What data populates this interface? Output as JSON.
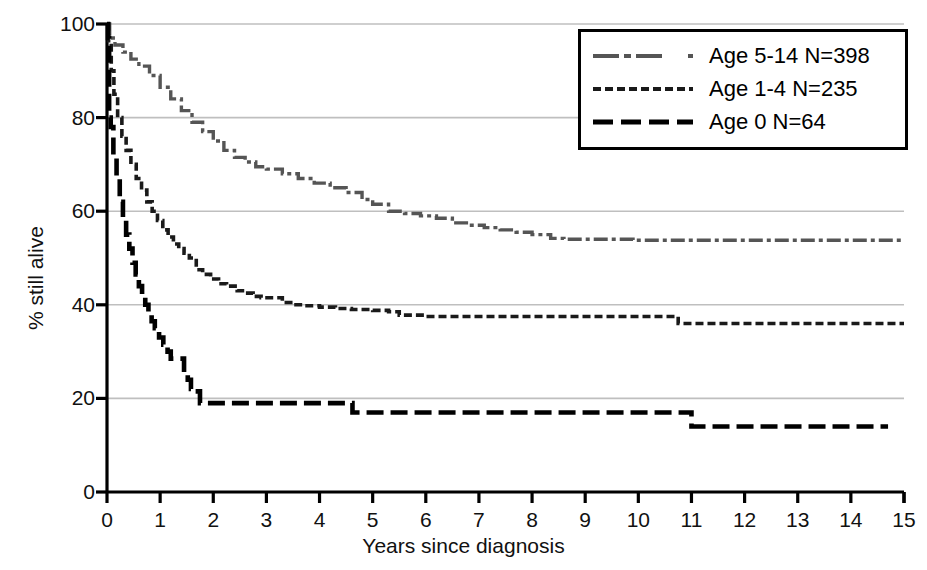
{
  "chart_data": {
    "type": "line",
    "title": "",
    "subtitle": "",
    "xlabel": "Years since diagnosis",
    "ylabel": "% still alive",
    "xlim": [
      0,
      15
    ],
    "ylim": [
      0,
      100
    ],
    "xticks": [
      "0",
      "1",
      "2",
      "3",
      "4",
      "5",
      "6",
      "7",
      "8",
      "9",
      "10",
      "11",
      "12",
      "13",
      "14",
      "15"
    ],
    "yticks": [
      "0",
      "20",
      "40",
      "60",
      "80",
      "100"
    ],
    "grid": "horizontal",
    "legend_position": "top-right",
    "series": [
      {
        "name": "Age 5-14 N=398",
        "label": "Age 5-14 N=398",
        "n": 398,
        "color": "#555555",
        "dash": "dash-dot",
        "points": [
          [
            0.0,
            100.0
          ],
          [
            0.05,
            97.0
          ],
          [
            0.15,
            95.5
          ],
          [
            0.3,
            94.0
          ],
          [
            0.45,
            92.5
          ],
          [
            0.6,
            91.0
          ],
          [
            0.8,
            89.0
          ],
          [
            1.0,
            86.5
          ],
          [
            1.2,
            84.0
          ],
          [
            1.4,
            81.5
          ],
          [
            1.6,
            79.0
          ],
          [
            1.8,
            77.0
          ],
          [
            2.0,
            75.0
          ],
          [
            2.2,
            73.0
          ],
          [
            2.4,
            71.5
          ],
          [
            2.6,
            70.5
          ],
          [
            2.8,
            69.5
          ],
          [
            3.0,
            69.0
          ],
          [
            3.3,
            68.0
          ],
          [
            3.6,
            67.0
          ],
          [
            3.9,
            66.0
          ],
          [
            4.2,
            65.0
          ],
          [
            4.5,
            64.0
          ],
          [
            4.8,
            62.5
          ],
          [
            5.0,
            61.5
          ],
          [
            5.3,
            60.0
          ],
          [
            5.6,
            59.5
          ],
          [
            5.9,
            59.0
          ],
          [
            6.2,
            58.5
          ],
          [
            6.4,
            58.5
          ],
          [
            6.5,
            57.5
          ],
          [
            6.8,
            57.0
          ],
          [
            7.1,
            56.5
          ],
          [
            7.4,
            56.0
          ],
          [
            7.7,
            55.5
          ],
          [
            8.0,
            55.0
          ],
          [
            8.2,
            55.0
          ],
          [
            8.35,
            54.2
          ],
          [
            8.6,
            54.0
          ],
          [
            9.0,
            54.0
          ],
          [
            9.4,
            54.0
          ],
          [
            9.8,
            54.0
          ],
          [
            9.9,
            53.8
          ],
          [
            10.3,
            53.8
          ],
          [
            11.0,
            53.8
          ],
          [
            12.0,
            53.8
          ],
          [
            13.0,
            53.8
          ],
          [
            14.0,
            53.8
          ],
          [
            15.0,
            53.8
          ]
        ]
      },
      {
        "name": "Age 1-4 N=235",
        "label": "Age 1-4 N=235",
        "n": 235,
        "color": "#1a1a1a",
        "dash": "dashed",
        "points": [
          [
            0.0,
            100.0
          ],
          [
            0.03,
            96.0
          ],
          [
            0.08,
            90.0
          ],
          [
            0.13,
            85.0
          ],
          [
            0.2,
            80.0
          ],
          [
            0.28,
            76.0
          ],
          [
            0.36,
            73.0
          ],
          [
            0.45,
            70.0
          ],
          [
            0.55,
            67.0
          ],
          [
            0.65,
            64.5
          ],
          [
            0.75,
            62.0
          ],
          [
            0.85,
            60.0
          ],
          [
            0.95,
            58.0
          ],
          [
            1.05,
            56.0
          ],
          [
            1.15,
            54.5
          ],
          [
            1.25,
            53.0
          ],
          [
            1.35,
            52.0
          ],
          [
            1.45,
            51.0
          ],
          [
            1.55,
            50.0
          ],
          [
            1.62,
            50.0
          ],
          [
            1.68,
            47.5
          ],
          [
            1.8,
            46.5
          ],
          [
            1.95,
            45.5
          ],
          [
            2.1,
            44.5
          ],
          [
            2.25,
            44.0
          ],
          [
            2.35,
            44.0
          ],
          [
            2.45,
            43.0
          ],
          [
            2.6,
            42.5
          ],
          [
            2.75,
            41.8
          ],
          [
            2.9,
            41.5
          ],
          [
            3.0,
            41.5
          ],
          [
            3.15,
            41.5
          ],
          [
            3.3,
            40.5
          ],
          [
            3.5,
            40.0
          ],
          [
            3.7,
            39.8
          ],
          [
            4.0,
            39.5
          ],
          [
            4.3,
            39.2
          ],
          [
            4.6,
            39.0
          ],
          [
            5.0,
            38.8
          ],
          [
            5.3,
            38.5
          ],
          [
            5.5,
            37.8
          ],
          [
            6.0,
            37.5
          ],
          [
            7.0,
            37.5
          ],
          [
            8.0,
            37.5
          ],
          [
            9.0,
            37.5
          ],
          [
            10.0,
            37.5
          ],
          [
            10.6,
            37.5
          ],
          [
            10.75,
            36.0
          ],
          [
            11.5,
            36.0
          ],
          [
            12.5,
            36.0
          ],
          [
            13.5,
            36.0
          ],
          [
            14.5,
            36.0
          ],
          [
            15.0,
            36.0
          ]
        ]
      },
      {
        "name": "Age 0 N=64",
        "label": "Age 0 N=64",
        "n": 64,
        "color": "#000000",
        "dash": "long-dash",
        "points": [
          [
            0.0,
            100.0
          ],
          [
            0.02,
            97.0
          ],
          [
            0.04,
            80.0
          ],
          [
            0.07,
            78.0
          ],
          [
            0.12,
            72.0
          ],
          [
            0.18,
            67.0
          ],
          [
            0.24,
            62.0
          ],
          [
            0.3,
            58.0
          ],
          [
            0.36,
            55.0
          ],
          [
            0.42,
            52.0
          ],
          [
            0.48,
            49.0
          ],
          [
            0.54,
            46.5
          ],
          [
            0.6,
            44.0
          ],
          [
            0.66,
            42.0
          ],
          [
            0.72,
            40.0
          ],
          [
            0.78,
            38.0
          ],
          [
            0.84,
            36.5
          ],
          [
            0.9,
            35.0
          ],
          [
            0.98,
            33.0
          ],
          [
            1.06,
            31.5
          ],
          [
            1.14,
            30.0
          ],
          [
            1.2,
            28.5
          ],
          [
            1.3,
            28.5
          ],
          [
            1.4,
            28.5
          ],
          [
            1.45,
            25.5
          ],
          [
            1.52,
            24.0
          ],
          [
            1.58,
            22.0
          ],
          [
            1.64,
            21.5
          ],
          [
            1.7,
            21.5
          ],
          [
            1.75,
            19.0
          ],
          [
            2.0,
            19.0
          ],
          [
            2.5,
            19.0
          ],
          [
            3.0,
            19.0
          ],
          [
            3.5,
            19.0
          ],
          [
            4.0,
            19.0
          ],
          [
            4.55,
            19.0
          ],
          [
            4.62,
            17.0
          ],
          [
            5.5,
            17.0
          ],
          [
            6.5,
            17.0
          ],
          [
            7.5,
            17.0
          ],
          [
            8.5,
            17.0
          ],
          [
            9.5,
            17.0
          ],
          [
            10.5,
            17.0
          ],
          [
            10.92,
            17.0
          ],
          [
            11.0,
            14.0
          ],
          [
            12.0,
            14.0
          ],
          [
            13.0,
            14.0
          ],
          [
            14.0,
            14.0
          ],
          [
            14.7,
            14.0
          ]
        ]
      }
    ],
    "legend": [
      {
        "label": "Age 5-14 N=398",
        "style": "dash-dot",
        "color": "#555555"
      },
      {
        "label": "Age 1-4 N=235",
        "style": "dashed",
        "color": "#1a1a1a"
      },
      {
        "label": "Age 0 N=64",
        "style": "long-dash",
        "color": "#000000"
      }
    ],
    "colors": {
      "axis": "#000000",
      "gridline": "#bfbfbf",
      "background": "#ffffff"
    }
  }
}
